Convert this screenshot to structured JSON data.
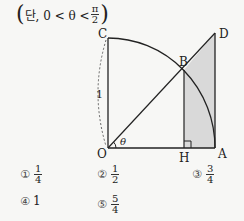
{
  "condition": {
    "prefix": "단, 0 < θ <",
    "frac_num": "π",
    "frac_den": "2",
    "open_paren": "(",
    "close_paren": ")"
  },
  "diagram": {
    "points": {
      "O": {
        "label": "O",
        "x": 108,
        "y": 148
      },
      "A": {
        "label": "A",
        "x": 215,
        "y": 148
      },
      "C": {
        "label": "C",
        "x": 108,
        "y": 38
      },
      "D": {
        "label": "D",
        "x": 215,
        "y": 33
      },
      "B": {
        "label": "B",
        "x": 184,
        "y": 70
      },
      "H": {
        "label": "H",
        "x": 184,
        "y": 148
      }
    },
    "radius_label": "1",
    "angle_label": "θ",
    "shade_color": "#d9d9d9",
    "line_color": "#222222"
  },
  "choices": [
    {
      "mark": "①",
      "type": "frac",
      "num": "1",
      "den": "4"
    },
    {
      "mark": "②",
      "type": "frac",
      "num": "1",
      "den": "2"
    },
    {
      "mark": "③",
      "type": "frac",
      "num": "3",
      "den": "4"
    },
    {
      "mark": "④",
      "type": "int",
      "value": "1"
    },
    {
      "mark": "⑤",
      "type": "frac",
      "num": "5",
      "den": "4"
    }
  ]
}
